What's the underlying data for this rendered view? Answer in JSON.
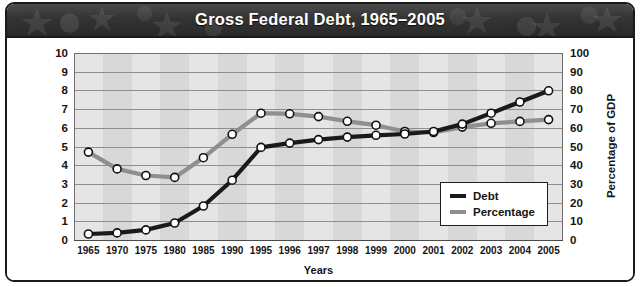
{
  "banner": {
    "title": "Gross Federal Debt, 1965–2005"
  },
  "colors": {
    "debt": "#1a1a1a",
    "percentage": "#8f8f8f",
    "marker_fill": "#ffffff",
    "marker_stroke": "#111111",
    "plot_background": "#d8d8d8",
    "gridline": "#8e8e8e",
    "banner_background": "#343434",
    "frame_border": "#1b1b1b"
  },
  "legend": {
    "position": "inside-bottom-right",
    "items": [
      {
        "label": "Debt",
        "color": "#1a1a1a"
      },
      {
        "label": "Percentage",
        "color": "#8f8f8f"
      }
    ]
  },
  "chart_data": {
    "type": "line",
    "title": "Gross Federal Debt, 1965–2005",
    "xlabel": "Years",
    "ylabel": "Debt (in trillions of dollars)",
    "y2label": "Percentage of GDP",
    "grid": true,
    "ylim": [
      0,
      10
    ],
    "y2lim": [
      0,
      100
    ],
    "yticks": [
      0,
      1,
      2,
      3,
      4,
      5,
      6,
      7,
      8,
      9,
      10
    ],
    "y2ticks": [
      0,
      10,
      20,
      30,
      40,
      50,
      60,
      70,
      80,
      90,
      100
    ],
    "categories": [
      "1965",
      "1970",
      "1975",
      "1980",
      "1985",
      "1990",
      "1995",
      "1996",
      "1997",
      "1998",
      "1999",
      "2000",
      "2001",
      "2002",
      "2003",
      "2004",
      "2005"
    ],
    "series": [
      {
        "name": "Debt",
        "axis": "left",
        "unit": "trillions of dollars",
        "color": "#1a1a1a",
        "values": [
          0.32,
          0.38,
          0.54,
          0.91,
          1.82,
          3.2,
          4.95,
          5.18,
          5.37,
          5.5,
          5.6,
          5.67,
          5.8,
          6.2,
          6.78,
          7.38,
          7.98
        ]
      },
      {
        "name": "Percentage",
        "axis": "right",
        "unit": "percentage of GDP",
        "color": "#8f8f8f",
        "values": [
          47,
          38,
          34.5,
          33.5,
          44,
          56.5,
          67.8,
          67.5,
          66,
          63.5,
          61.4,
          58,
          57.5,
          60.4,
          62.4,
          63.4,
          64.4
        ]
      }
    ]
  }
}
